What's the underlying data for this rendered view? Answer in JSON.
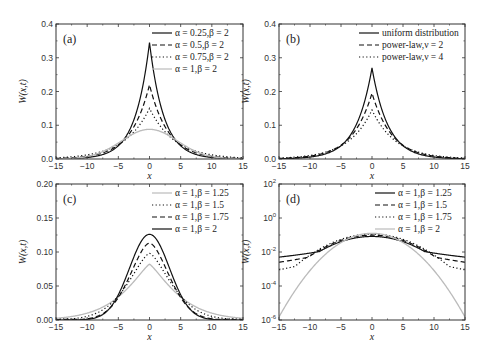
{
  "figure": {
    "panels": [
      "(a)",
      "(b)",
      "(c)",
      "(d)"
    ]
  },
  "chart_data": [
    {
      "id": "a",
      "type": "line",
      "panel_label": "(a)",
      "xlabel": "x",
      "ylabel": "W(x,t)",
      "xlim": [
        -15,
        15
      ],
      "ylim": [
        0.0,
        0.4
      ],
      "xticks": [
        "-15",
        "-10",
        "-5",
        "0",
        "5",
        "10",
        "15"
      ],
      "yticks": [
        "0.0",
        "0.1",
        "0.2",
        "0.3",
        "0.4"
      ],
      "yscale": "linear",
      "legend_position": "upper right",
      "series": [
        {
          "name": "α = 0.25,β = 2",
          "style": "solid",
          "color": "#111111",
          "peak": 0.345,
          "shape": "cusp",
          "width": 2.3
        },
        {
          "name": "α = 0.5,β = 2",
          "style": "dashed",
          "color": "#111111",
          "peak": 0.22,
          "shape": "cusp",
          "width": 3.0
        },
        {
          "name": "α = 0.75,β = 2",
          "style": "dotted",
          "color": "#111111",
          "peak": 0.15,
          "shape": "cusp",
          "width": 4.0
        },
        {
          "name": "α = 1,β = 2",
          "style": "solid",
          "color": "#bbbbbb",
          "peak": 0.088,
          "shape": "gauss",
          "width": 4.5
        }
      ]
    },
    {
      "id": "b",
      "type": "line",
      "panel_label": "(b)",
      "xlabel": "x",
      "ylabel": "W(x,t)",
      "xlim": [
        -15,
        15
      ],
      "ylim": [
        0.0,
        0.4
      ],
      "xticks": [
        "-15",
        "-10",
        "-5",
        "0",
        "5",
        "10",
        "15"
      ],
      "yticks": [
        "0.0",
        "0.1",
        "0.2",
        "0.3",
        "0.4"
      ],
      "yscale": "linear",
      "legend_position": "upper right",
      "series": [
        {
          "name": "uniform distribution",
          "style": "solid",
          "color": "#111111",
          "peak": 0.27,
          "shape": "cusp",
          "width": 2.6
        },
        {
          "name": "power-law,ν = 2",
          "style": "dashed",
          "color": "#111111",
          "peak": 0.195,
          "shape": "cusp",
          "width": 3.2
        },
        {
          "name": "power-law,ν = 4",
          "style": "dotted",
          "color": "#111111",
          "peak": 0.145,
          "shape": "cusp",
          "width": 3.8
        }
      ]
    },
    {
      "id": "c",
      "type": "line",
      "panel_label": "(c)",
      "xlabel": "x",
      "ylabel": "W(x,t)",
      "xlim": [
        -15,
        15
      ],
      "ylim": [
        0.0,
        0.2
      ],
      "xticks": [
        "-15",
        "-10",
        "-5",
        "0",
        "5",
        "10",
        "15"
      ],
      "yticks": [
        "0.00",
        "0.05",
        "0.10",
        "0.15",
        "0.20"
      ],
      "yscale": "linear",
      "legend_position": "upper right",
      "series": [
        {
          "name": "α = 1,β = 1.25",
          "style": "solid",
          "color": "#bbbbbb",
          "peak": 0.082,
          "shape": "levy",
          "beta": 1.25
        },
        {
          "name": "α = 1,β = 1.5",
          "style": "dotted",
          "color": "#111111",
          "peak": 0.098,
          "shape": "levy",
          "beta": 1.5
        },
        {
          "name": "α = 1,β = 1.75",
          "style": "dashed",
          "color": "#111111",
          "peak": 0.113,
          "shape": "levy",
          "beta": 1.75
        },
        {
          "name": "α = 1,β = 2",
          "style": "solid",
          "color": "#111111",
          "peak": 0.126,
          "shape": "levy",
          "beta": 2.0
        }
      ]
    },
    {
      "id": "d",
      "type": "line",
      "panel_label": "(d)",
      "xlabel": "x",
      "ylabel": "W(x,t)",
      "xlim": [
        -15,
        15
      ],
      "ylim": [
        1e-06,
        100
      ],
      "xticks": [
        "-15",
        "-10",
        "-5",
        "0",
        "5",
        "10",
        "15"
      ],
      "yticks": [
        "10^-6",
        "10^-4",
        "10^-2",
        "10^0",
        "10^2"
      ],
      "yscale": "log",
      "legend_position": "upper right",
      "series": [
        {
          "name": "α = 1,β = 1.25",
          "style": "solid",
          "color": "#111111",
          "peak": 0.082,
          "tail_at_15": 0.005
        },
        {
          "name": "α = 1,β = 1.5",
          "style": "dashed",
          "color": "#111111",
          "peak": 0.098,
          "tail_at_15": 0.0025
        },
        {
          "name": "α = 1,β = 1.75",
          "style": "dotted",
          "color": "#111111",
          "peak": 0.113,
          "tail_at_15": 0.0009
        },
        {
          "name": "α = 1,β = 2",
          "style": "solid",
          "color": "#bbbbbb",
          "peak": 0.126,
          "tail_at_15": 1.5e-06
        }
      ]
    }
  ]
}
